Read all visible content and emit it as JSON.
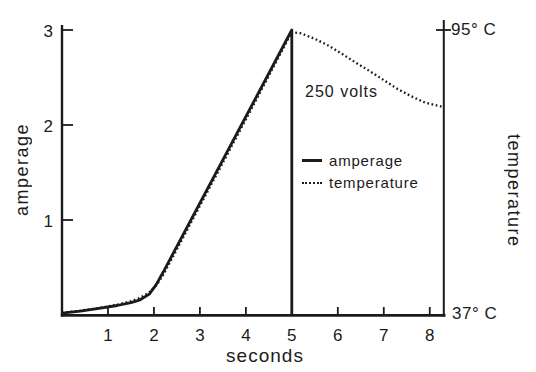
{
  "colors": {
    "ink": "#1b1b1b",
    "background": "#ffffff"
  },
  "legend": {
    "items": [
      {
        "label": "amperage",
        "style": "solid"
      },
      {
        "label": "temperature",
        "style": "dotted"
      }
    ]
  },
  "chart_data": {
    "type": "line",
    "title": "",
    "xlabel": "seconds",
    "ylabel_left": "amperage",
    "ylabel_right": "temperature",
    "annotation": "250 volts",
    "x_range": [
      0,
      8.31
    ],
    "x_ticks": [
      1,
      2,
      3,
      4,
      5,
      6,
      7,
      8
    ],
    "left_ticks": [
      1,
      2,
      3
    ],
    "amp_range": [
      0,
      3
    ],
    "temp_range": [
      37,
      95
    ],
    "temp_axis_labels": {
      "top": "95° C",
      "bottom": "37° C"
    },
    "grid": false,
    "legend_position": "center-right",
    "series": [
      {
        "name": "amperage",
        "axis": "amp",
        "style": "solid",
        "points": [
          [
            0,
            0.02
          ],
          [
            0.4,
            0.04
          ],
          [
            0.8,
            0.07
          ],
          [
            1.2,
            0.1
          ],
          [
            1.5,
            0.13
          ],
          [
            1.7,
            0.16
          ],
          [
            1.9,
            0.22
          ],
          [
            2.05,
            0.32
          ],
          [
            2.2,
            0.45
          ],
          [
            5.0,
            3.0
          ],
          [
            5.0,
            0.0
          ]
        ]
      },
      {
        "name": "temperature",
        "axis": "temp",
        "style": "dotted",
        "points": [
          [
            0,
            37.4
          ],
          [
            0.4,
            37.9
          ],
          [
            0.8,
            38.4
          ],
          [
            1.2,
            39.1
          ],
          [
            1.5,
            39.8
          ],
          [
            1.7,
            40.5
          ],
          [
            1.9,
            41.6
          ],
          [
            2.05,
            43.0
          ],
          [
            2.2,
            45.1
          ],
          [
            3.0,
            59.2
          ],
          [
            4.0,
            76.8
          ],
          [
            4.6,
            87.5
          ],
          [
            5.0,
            94.6
          ],
          [
            5.2,
            94.3
          ],
          [
            5.5,
            93.2
          ],
          [
            5.8,
            91.8
          ],
          [
            6.1,
            90.1
          ],
          [
            6.4,
            88.3
          ],
          [
            6.7,
            86.6
          ],
          [
            7.0,
            84.8
          ],
          [
            7.3,
            83.0
          ],
          [
            7.6,
            81.5
          ],
          [
            7.9,
            80.2
          ],
          [
            8.31,
            79.3
          ]
        ]
      }
    ]
  }
}
